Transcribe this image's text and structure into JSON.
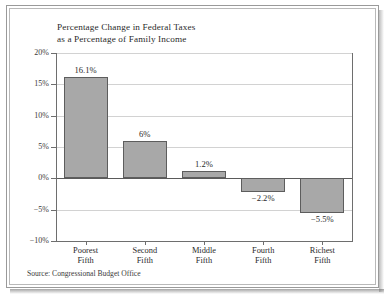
{
  "chart_data": {
    "type": "bar",
    "title": "Percentage Change in Federal Taxes as a Percentage of Family Income",
    "title_lines": [
      "Percentage Change in Federal Taxes",
      "as a Percentage of Family Income"
    ],
    "categories": [
      "Poorest Fifth",
      "Second Fifth",
      "Middle Fifth",
      "Fourth Fifth",
      "Richest Fifth"
    ],
    "category_lines": [
      [
        "Poorest",
        "Fifth"
      ],
      [
        "Second",
        "Fifth"
      ],
      [
        "Middle",
        "Fifth"
      ],
      [
        "Fourth",
        "Fifth"
      ],
      [
        "Richest",
        "Fifth"
      ]
    ],
    "values": [
      16.1,
      6,
      1.2,
      -2.2,
      -5.5
    ],
    "value_labels": [
      "16.1%",
      "6%",
      "1.2%",
      "−2.2%",
      "−5.5%"
    ],
    "xlabel": "",
    "ylabel": "",
    "ylim": [
      -10,
      20
    ],
    "yticks": [
      20,
      15,
      10,
      5,
      0,
      -5,
      -10
    ],
    "ytick_labels": [
      "20%",
      "15%",
      "10%",
      "5%",
      "0%",
      "−5%",
      "−10%"
    ],
    "grid": true,
    "legend": false,
    "bar_color": "#a8a8a8",
    "bar_edge_color": "#5d5d5d",
    "gridline_color": "#d2d2d2",
    "axis_color": "#6e6e6e"
  },
  "source": {
    "text": "Source: Congressional Budget Office"
  }
}
